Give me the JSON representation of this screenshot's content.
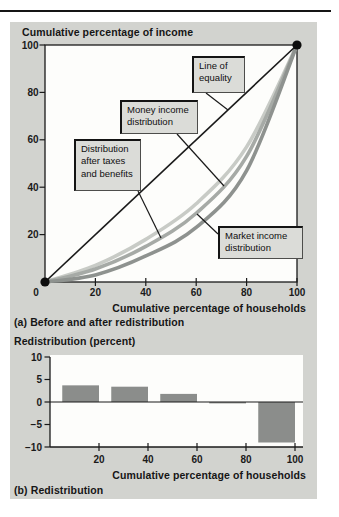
{
  "colors": {
    "panel_bg": "#d2d3cf",
    "plot_bg": "#fdfdfb",
    "ink": "#1a1a1a",
    "callout_bg": "#dbdcd8",
    "bar": "#8b8d8b",
    "equality_line": "#1a1a1a",
    "after_taxes_curve": "#c8cbc6",
    "money_curve": "#a6aaa6",
    "market_curve": "#8e928f"
  },
  "chart_a": {
    "title": "Cumulative percentage of income",
    "xlabel": "Cumulative percentage of households",
    "caption": "(a) Before and after redistribution"
  },
  "chart_b": {
    "title": "Redistribution (percent)",
    "xlabel": "Cumulative percentage of households",
    "caption": "(b) Redistribution"
  },
  "chart_data": [
    {
      "type": "line",
      "title": "Cumulative percentage of income",
      "xlabel": "Cumulative percentage of households",
      "xlim": [
        0,
        100
      ],
      "ylim": [
        0,
        100
      ],
      "xticks": [
        0,
        20,
        40,
        60,
        80,
        100
      ],
      "yticks": [
        20,
        40,
        60,
        80,
        100
      ],
      "grid": false,
      "series": [
        {
          "name": "Distribution after taxes and benefits",
          "x": [
            0,
            20,
            40,
            60,
            80,
            100
          ],
          "y": [
            0,
            7,
            18,
            33,
            57,
            100
          ],
          "color_key": "after_taxes_curve",
          "width": 3.6
        },
        {
          "name": "Money income distribution",
          "x": [
            0,
            20,
            40,
            60,
            80,
            100
          ],
          "y": [
            0,
            5.5,
            15,
            29,
            53,
            100
          ],
          "color_key": "money_curve",
          "width": 3.6
        },
        {
          "name": "Market income distribution",
          "x": [
            0,
            20,
            40,
            60,
            80,
            100
          ],
          "y": [
            0,
            3,
            11,
            23,
            47,
            100
          ],
          "color_key": "market_curve",
          "width": 3.6
        },
        {
          "name": "Line of equality",
          "x": [
            0,
            100
          ],
          "y": [
            0,
            100
          ],
          "color_key": "equality_line",
          "width": 1.6,
          "straight": true,
          "end_dots": true
        }
      ],
      "annotations": [
        {
          "id": "line-of-equality",
          "label": "Line of\nequality",
          "box": [
            182,
            34,
            53,
            37
          ],
          "pointer": [
            [
              196,
              71
            ],
            [
              218,
              88
            ]
          ]
        },
        {
          "id": "money-income-distribution",
          "label": "Money income\ndistribution",
          "box": [
            110,
            78,
            78,
            34
          ],
          "pointer": [
            [
              167,
              112
            ],
            [
              214,
              164
            ]
          ]
        },
        {
          "id": "distribution-after-taxes-and-benefits",
          "label": "Distribution\nafter taxes\nand benefits",
          "box": [
            64,
            117,
            67,
            52
          ],
          "pointer": [
            [
              128,
              169
            ],
            [
              151,
              216
            ]
          ]
        },
        {
          "id": "market-income-distribution",
          "label": "Market income\ndistribution",
          "box": [
            208,
            204,
            85,
            33
          ],
          "pointer": [
            [
              208,
              212
            ],
            [
              187,
              192
            ]
          ]
        }
      ]
    },
    {
      "type": "bar",
      "title": "Redistribution (percent)",
      "xlabel": "Cumulative percentage of households",
      "xlim": [
        0,
        103
      ],
      "ylim": [
        -10,
        10
      ],
      "xticks": [
        20,
        40,
        60,
        80,
        100
      ],
      "yticks": [
        -10,
        -5,
        0,
        5,
        10
      ],
      "grid": false,
      "bars": [
        {
          "x0": 5,
          "x1": 20,
          "value": 3.7
        },
        {
          "x0": 25,
          "x1": 40,
          "value": 3.4
        },
        {
          "x0": 45,
          "x1": 60,
          "value": 1.8
        },
        {
          "x0": 65,
          "x1": 80,
          "value": -0.3
        },
        {
          "x0": 85,
          "x1": 100,
          "value": -9
        }
      ]
    }
  ]
}
